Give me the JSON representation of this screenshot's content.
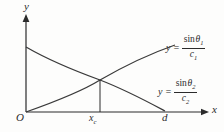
{
  "figure": {
    "type": "line-plot-diagram",
    "background_color": "#fdfdfc",
    "stroke_color": "#2b2b2b",
    "axes": {
      "x_axis_label": "x",
      "y_axis_label": "y",
      "origin_label": "O",
      "x_ticks": [
        {
          "name": "x-c-tick",
          "label_main": "x",
          "label_sub": "c"
        },
        {
          "name": "d-tick",
          "label_main": "d",
          "label_sub": ""
        }
      ]
    },
    "curves": [
      {
        "name": "sin-theta-1-over-c1-curve",
        "shape": "increasing-concave-down",
        "label": {
          "lhs": "y =",
          "numerator_fn": "sin",
          "numerator_var": "θ",
          "numerator_sub": "1",
          "denominator_var": "c",
          "denominator_sub": "1"
        }
      },
      {
        "name": "sin-theta-2-over-c2-curve",
        "shape": "decreasing-concave-down",
        "label": {
          "lhs": "y =",
          "numerator_fn": "sin",
          "numerator_var": "θ",
          "numerator_sub": "2",
          "denominator_var": "c",
          "denominator_sub": "2"
        }
      }
    ],
    "intersection": {
      "name": "curve-intersection-point",
      "dropline_to_x_label_main": "x",
      "dropline_to_x_label_sub": "c"
    }
  }
}
